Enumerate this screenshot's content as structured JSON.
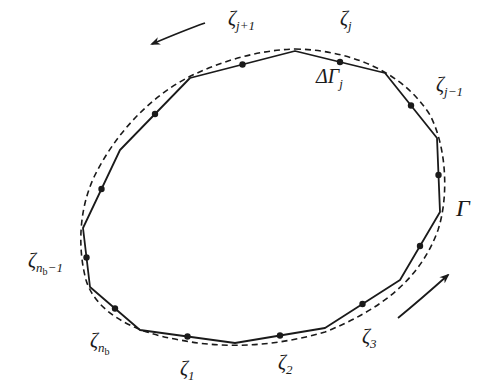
{
  "diagram": {
    "colors": {
      "stroke": "#1a1a1a",
      "background": "#ffffff"
    },
    "contour_label": "Γ",
    "segment_label": {
      "main": "ΔΓ",
      "sub": "j"
    },
    "polygon_vertices": [
      [
        295,
        51
      ],
      [
        385,
        73
      ],
      [
        437,
        138
      ],
      [
        440,
        212
      ],
      [
        400,
        280
      ],
      [
        325,
        328
      ],
      [
        235,
        343
      ],
      [
        140,
        330
      ],
      [
        90,
        287
      ],
      [
        83,
        228
      ],
      [
        120,
        150
      ],
      [
        190,
        78
      ]
    ],
    "curve_path": "M 295 49 C 345 50, 400 68, 430 115 C 448 150, 448 200, 438 230 C 420 280, 380 310, 325 332 C 280 345, 230 350, 180 340 C 130 332, 95 310, 86 280 C 78 250, 78 210, 95 175 C 115 135, 150 95, 195 74 C 225 60, 260 50, 295 49 Z",
    "nodes": [
      {
        "name": "zeta-1",
        "base": "ζ",
        "sub": "1",
        "sub2": ""
      },
      {
        "name": "zeta-2",
        "base": "ζ",
        "sub": "2",
        "sub2": ""
      },
      {
        "name": "zeta-3",
        "base": "ζ",
        "sub": "3",
        "sub2": ""
      },
      {
        "name": "zeta-j-minus-1",
        "base": "ζ",
        "sub": "j−1",
        "sub2": ""
      },
      {
        "name": "zeta-j",
        "base": "ζ",
        "sub": "j",
        "sub2": ""
      },
      {
        "name": "zeta-j-plus-1",
        "base": "ζ",
        "sub": "j+1",
        "sub2": ""
      },
      {
        "name": "zeta-nb-minus-1",
        "base": "ζ",
        "sub": "n",
        "sub2": "b",
        "suffix": "−1"
      },
      {
        "name": "zeta-nb",
        "base": "ζ",
        "sub": "n",
        "sub2": "b",
        "suffix": ""
      }
    ],
    "arrows": [
      {
        "name": "arrow-top-left",
        "direction": "counterclockwise"
      },
      {
        "name": "arrow-bottom-right",
        "direction": "counterclockwise"
      }
    ]
  }
}
